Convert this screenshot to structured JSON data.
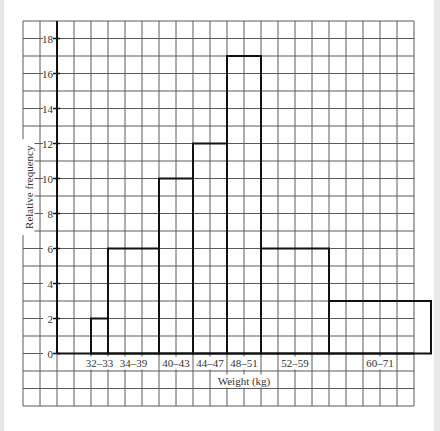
{
  "chart_data": {
    "type": "bar",
    "subtype": "histogram",
    "title": "",
    "xlabel": "Weight (kg)",
    "ylabel": "Relative frequency",
    "categories": [
      "32–33",
      "34–39",
      "40–43",
      "44–47",
      "48–51",
      "52–59",
      "60–71"
    ],
    "bins": [
      {
        "label": "32–33",
        "start": 32,
        "end": 34,
        "value": 2
      },
      {
        "label": "34–39",
        "start": 34,
        "end": 40,
        "value": 6
      },
      {
        "label": "40–43",
        "start": 40,
        "end": 44,
        "value": 10
      },
      {
        "label": "44–47",
        "start": 44,
        "end": 48,
        "value": 12
      },
      {
        "label": "48–51",
        "start": 48,
        "end": 52,
        "value": 17
      },
      {
        "label": "52–59",
        "start": 52,
        "end": 60,
        "value": 6
      },
      {
        "label": "60–71",
        "start": 60,
        "end": 72,
        "value": 3
      }
    ],
    "values": [
      2,
      6,
      10,
      12,
      17,
      6,
      3
    ],
    "yticks": [
      "0",
      "2",
      "4",
      "6",
      "8",
      "10",
      "12",
      "14",
      "16",
      "18"
    ],
    "ylim": [
      0,
      19
    ],
    "xlim": [
      28,
      74
    ],
    "grid": true,
    "legend": "none"
  }
}
